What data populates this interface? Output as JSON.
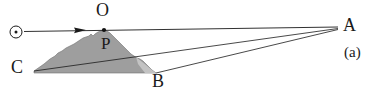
{
  "figure": {
    "caption": "(a)",
    "labels": {
      "sun": "sun-symbol",
      "O": "O",
      "P": "P",
      "C": "C",
      "B": "B",
      "A": "A"
    },
    "colors": {
      "line": "#1a1a1a",
      "mountain_fill": "#9e9e9e",
      "mountain_fill_light": "#c9c9c9",
      "background": "#ffffff",
      "text": "#1a1a1a"
    },
    "geometry": {
      "sun_center": [
        16,
        32
      ],
      "sun_radius": 6,
      "ray_arrow_tip": [
        85,
        30
      ],
      "point_O": [
        104,
        29
      ],
      "point_P": [
        104,
        31
      ],
      "point_C": [
        33,
        70
      ],
      "point_B": [
        157,
        73
      ],
      "point_A": [
        338,
        27
      ]
    }
  }
}
